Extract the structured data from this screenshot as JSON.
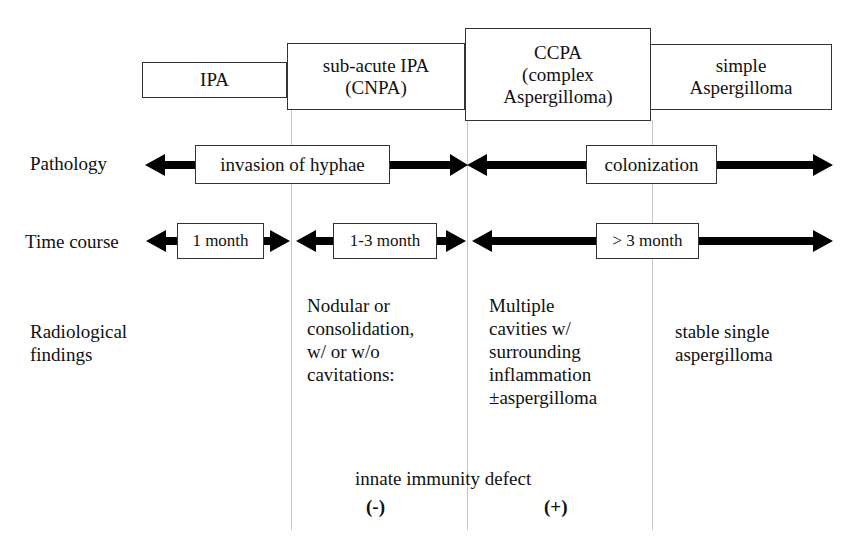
{
  "stages": [
    {
      "id": "ipa",
      "label": "IPA"
    },
    {
      "id": "cnpa",
      "label": "sub-acute IPA\n(CNPA)"
    },
    {
      "id": "ccpa",
      "label": "CCPA\n(complex\nAspergilloma)"
    },
    {
      "id": "simple",
      "label": "simple\nAspergilloma"
    }
  ],
  "rows": {
    "pathology": {
      "label": "Pathology",
      "segments": [
        {
          "label": "invasion of hyphae"
        },
        {
          "label": "colonization"
        }
      ]
    },
    "time_course": {
      "label": "Time course",
      "segments": [
        {
          "label": "1 month"
        },
        {
          "label": "1-3 month"
        },
        {
          "label": "> 3 month"
        }
      ]
    },
    "radiological": {
      "label": "Radiological\nfindings",
      "cells": [
        {
          "text": "Nodular or\nconsolidation,\nw/ or w/o\ncavitations:"
        },
        {
          "text": "Multiple\ncavities w/\nsurrounding\ninflammation\n±aspergilloma"
        },
        {
          "text": "stable single\naspergilloma"
        }
      ]
    }
  },
  "immunity": {
    "title": "innate immunity defect",
    "negative": "(-)",
    "positive": "(+)"
  },
  "colors": {
    "arrow": "#000000",
    "box_border": "#333333",
    "divider": "#c8c8c8"
  }
}
